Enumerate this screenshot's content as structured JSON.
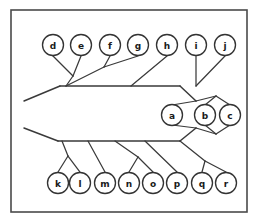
{
  "figure": {
    "frame": {
      "x": 11,
      "y": 10,
      "width": 236,
      "height": 202
    },
    "colors": {
      "background": "#ffffff",
      "frame_stroke": "#4a4a4a",
      "branch_stroke": "#3a3a3a",
      "node_fill": "#ffffff",
      "node_stroke": "#333333",
      "label_color": "#1a1a1a"
    },
    "node_radius": 10.5
  },
  "nodes": [
    {
      "id": "d",
      "label": "d",
      "cx": 53,
      "cy": 45,
      "group": "upper"
    },
    {
      "id": "e",
      "label": "e",
      "cx": 81,
      "cy": 45,
      "group": "upper"
    },
    {
      "id": "f",
      "label": "f",
      "cx": 110,
      "cy": 45,
      "group": "upper"
    },
    {
      "id": "g",
      "label": "g",
      "cx": 138,
      "cy": 45,
      "group": "upper"
    },
    {
      "id": "h",
      "label": "h",
      "cx": 167,
      "cy": 45,
      "group": "upper"
    },
    {
      "id": "i",
      "label": "i",
      "cx": 196,
      "cy": 45,
      "group": "upper"
    },
    {
      "id": "j",
      "label": "j",
      "cx": 225,
      "cy": 45,
      "group": "upper"
    },
    {
      "id": "a",
      "label": "a",
      "cx": 172,
      "cy": 115,
      "group": "right"
    },
    {
      "id": "b",
      "label": "b",
      "cx": 205,
      "cy": 115,
      "group": "right"
    },
    {
      "id": "c",
      "label": "c",
      "cx": 230,
      "cy": 115,
      "group": "right"
    },
    {
      "id": "k",
      "label": "k",
      "cx": 58,
      "cy": 183,
      "group": "lower"
    },
    {
      "id": "l",
      "label": "l",
      "cx": 80,
      "cy": 183,
      "group": "lower"
    },
    {
      "id": "m",
      "label": "m",
      "cx": 105,
      "cy": 183,
      "group": "lower"
    },
    {
      "id": "n",
      "label": "n",
      "cx": 129,
      "cy": 183,
      "group": "lower"
    },
    {
      "id": "o",
      "label": "o",
      "cx": 153,
      "cy": 183,
      "group": "lower"
    },
    {
      "id": "p",
      "label": "p",
      "cx": 177,
      "cy": 183,
      "group": "lower"
    },
    {
      "id": "q",
      "label": "q",
      "cx": 202,
      "cy": 183,
      "group": "lower"
    },
    {
      "id": "r",
      "label": "r",
      "cx": 226,
      "cy": 183,
      "group": "lower"
    }
  ],
  "spines": [
    {
      "id": "upper-spine",
      "points": "60,86 180,86"
    },
    {
      "id": "lower-spine",
      "points": "58,141 180,141"
    },
    {
      "id": "upper-left-tail",
      "points": "24,101 60,86"
    },
    {
      "id": "lower-left-tail",
      "points": "24,128 58,141"
    },
    {
      "id": "upper-to-hub",
      "points": "180,86 196,101"
    },
    {
      "id": "lower-to-hub",
      "points": "180,141 196,128"
    }
  ],
  "branches": [
    {
      "id": "branch-d",
      "points": "53,56 73,76"
    },
    {
      "id": "branch-e",
      "points": "81,56 73,76"
    },
    {
      "id": "branch-de-stem",
      "points": "73,76 66,86"
    },
    {
      "id": "branch-f",
      "points": "110,56 104,67"
    },
    {
      "id": "branch-f-stem",
      "points": "104,67 66,86"
    },
    {
      "id": "branch-g",
      "points": "138,56 104,67"
    },
    {
      "id": "branch-h",
      "points": "167,56 131,86"
    },
    {
      "id": "branch-i",
      "points": "196,56 196,86"
    },
    {
      "id": "branch-j",
      "points": "225,56 196,86"
    },
    {
      "id": "branch-a",
      "points": "172,105 196,101"
    },
    {
      "id": "branch-b",
      "points": "205,105 216,96"
    },
    {
      "id": "branch-c",
      "points": "230,105 216,96"
    },
    {
      "id": "branch-bc-stem",
      "points": "216,96 196,101"
    },
    {
      "id": "branch-a-lower",
      "points": "172,125 196,128"
    },
    {
      "id": "branch-b-lower",
      "points": "205,125 216,134"
    },
    {
      "id": "branch-c-lower",
      "points": "230,125 216,134"
    },
    {
      "id": "branch-bc-lower-stem",
      "points": "216,134 196,128"
    },
    {
      "id": "branch-k",
      "points": "58,172 68,156"
    },
    {
      "id": "branch-l",
      "points": "80,172 68,156"
    },
    {
      "id": "branch-kl-stem",
      "points": "68,156 62,141"
    },
    {
      "id": "branch-m",
      "points": "105,172 88,141"
    },
    {
      "id": "branch-n",
      "points": "129,172 138,157"
    },
    {
      "id": "branch-o",
      "points": "153,172 138,157"
    },
    {
      "id": "branch-no-stem",
      "points": "138,157 115,141"
    },
    {
      "id": "branch-p",
      "points": "177,172 145,141"
    },
    {
      "id": "branch-q",
      "points": "202,172 205,161"
    },
    {
      "id": "branch-r",
      "points": "226,172 205,161"
    },
    {
      "id": "branch-qr-stem",
      "points": "205,161 180,141"
    }
  ]
}
